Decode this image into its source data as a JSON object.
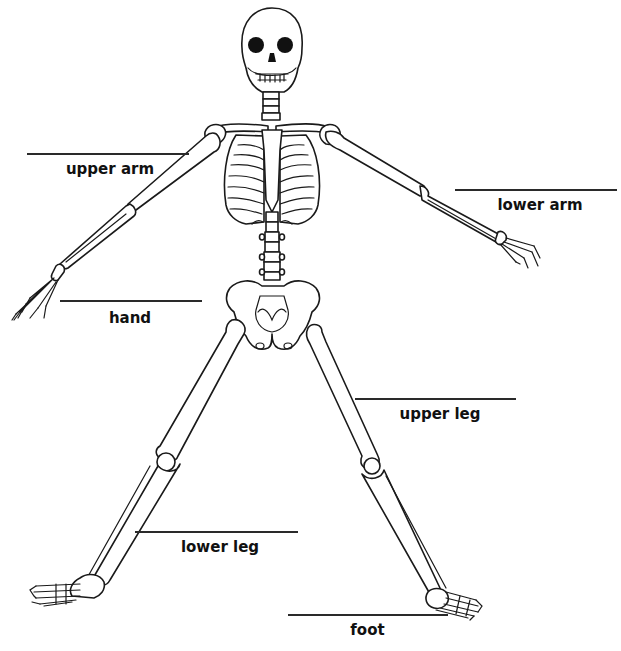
{
  "diagram": {
    "colors": {
      "line": "#1a1a1a",
      "label": "#111111",
      "background": "#ffffff"
    },
    "labels": [
      {
        "id": "upper-arm",
        "text": "upper arm",
        "line": {
          "x": 27,
          "y": 153,
          "w": 162
        },
        "text_pos": {
          "x": 55,
          "y": 160,
          "w": 110
        }
      },
      {
        "id": "lower-arm",
        "text": "lower arm",
        "line": {
          "x": 455,
          "y": 189,
          "w": 162
        },
        "text_pos": {
          "x": 480,
          "y": 196,
          "w": 120
        }
      },
      {
        "id": "hand",
        "text": "hand",
        "line": {
          "x": 60,
          "y": 300,
          "w": 142
        },
        "text_pos": {
          "x": 100,
          "y": 309,
          "w": 60
        }
      },
      {
        "id": "upper-leg",
        "text": "upper leg",
        "line": {
          "x": 355,
          "y": 398,
          "w": 161
        },
        "text_pos": {
          "x": 390,
          "y": 405,
          "w": 100
        }
      },
      {
        "id": "lower-leg",
        "text": "lower leg",
        "line": {
          "x": 135,
          "y": 531,
          "w": 163
        },
        "text_pos": {
          "x": 170,
          "y": 538,
          "w": 100
        }
      },
      {
        "id": "foot",
        "text": "foot",
        "line": {
          "x": 288,
          "y": 614,
          "w": 160
        },
        "text_pos": {
          "x": 340,
          "y": 621,
          "w": 55
        }
      }
    ]
  }
}
